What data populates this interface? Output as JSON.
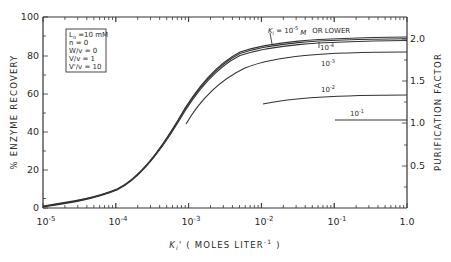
{
  "chart_data": {
    "type": "line",
    "title": "",
    "xlabel": "Ki' ( MOLES LITER^-1 )",
    "ylabel": "% ENZYME RECOVERY",
    "ylabel_right": "PURIFICATION FACTOR",
    "xscale": "log",
    "xlim": [
      1e-05,
      1.0
    ],
    "ylim": [
      0,
      100
    ],
    "ylim_right": [
      0,
      2.25
    ],
    "x_tick_labels": [
      "10^-5",
      "10^-4",
      "10^-3",
      "10^-2",
      "10^-1",
      "1.0"
    ],
    "y_tick_labels": [
      "0",
      "20",
      "40",
      "60",
      "80",
      "100"
    ],
    "y_right_tick_labels": [
      "0.5",
      "1.0",
      "1.5",
      "2.0"
    ],
    "grid": false,
    "conditions_box": [
      "L0 = 10 mM",
      "n = 0",
      "W/v = 0",
      "V/v = 1",
      "V'/v = 10"
    ],
    "series": [
      {
        "name": "Ki = 10^-5 M or lower",
        "x": [
          1e-05,
          3e-05,
          0.0001,
          0.0003,
          0.001,
          0.003,
          0.01,
          0.03,
          0.1,
          0.3,
          1.0
        ],
        "values": [
          1,
          4,
          10,
          25,
          48,
          70,
          82,
          87,
          88.5,
          89,
          89
        ]
      },
      {
        "name": "10^-4",
        "x": [
          1e-05,
          3e-05,
          0.0001,
          0.0003,
          0.001,
          0.003,
          0.01,
          0.03,
          0.1,
          0.3,
          1.0
        ],
        "values": [
          1,
          4,
          10,
          24,
          47,
          69,
          81,
          86,
          87.5,
          88,
          88
        ]
      },
      {
        "name": "10^-3",
        "x": [
          0.001,
          0.003,
          0.01,
          0.03,
          0.1,
          0.3,
          1.0
        ],
        "values": [
          45,
          63,
          74,
          79,
          81,
          82,
          82
        ]
      },
      {
        "name": "10^-2",
        "x": [
          0.01,
          0.03,
          0.1,
          0.3,
          1.0
        ],
        "values": [
          55,
          58,
          59.5,
          60,
          60
        ]
      },
      {
        "name": "10^-1",
        "x": [
          0.1,
          0.3,
          1.0
        ],
        "values": [
          46,
          46,
          46
        ]
      }
    ],
    "annotations": [
      "Ki = 10^-5 M OR LOWER",
      "10^-4",
      "10^-3",
      "10^-2",
      "10^-1"
    ]
  },
  "labels": {
    "note_line1": "L",
    "note_line1_sub": "o",
    "note_line1_rest": " =10 mM",
    "note_line2": "n   = 0",
    "note_line3": "W/v = 0",
    "note_line4": "V/v = 1",
    "note_line5": "V'/v = 10",
    "ylabel": "% ENZYME RECOVERY",
    "ylabel_right": "PURIFICATION FACTOR",
    "xlabel_k": "K",
    "xlabel_sub": "i",
    "xlabel_rest": "' ( MOLES LITER",
    "xlabel_sup": "-1",
    "xlabel_end": " )",
    "curve1_k": "K",
    "curve1_sub": "i",
    "curve1_eq": " = 10",
    "curve1_sup": "-5",
    "curve1_unit": "M",
    "curve1_tail": "OR LOWER",
    "curve2_base": "10",
    "curve2_sup": "-4",
    "curve3_base": "10",
    "curve3_sup": "-3",
    "curve4_base": "10",
    "curve4_sup": "-2",
    "curve5_base": "10",
    "curve5_sup": "-1",
    "xt": [
      {
        "base": "10",
        "sup": "-5"
      },
      {
        "base": "10",
        "sup": "-4"
      },
      {
        "base": "10",
        "sup": "-3"
      },
      {
        "base": "10",
        "sup": "-2"
      },
      {
        "base": "10",
        "sup": "-1"
      },
      {
        "base": "1.0",
        "sup": ""
      }
    ],
    "yt": [
      "0",
      "20",
      "40",
      "60",
      "80",
      "100"
    ],
    "yrt": [
      "0.5",
      "1.0",
      "1.5",
      "2.0"
    ]
  }
}
